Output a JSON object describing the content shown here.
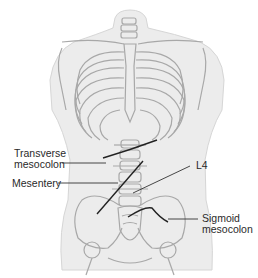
{
  "figure": {
    "colors": {
      "body": "#ececec",
      "bone": "#a8a8a8",
      "leader": "#333333",
      "vessel": "#222222"
    },
    "labels": {
      "transverse_mesocolon": "Transverse\nmesocolon",
      "transverse_line1": "Transverse",
      "transverse_line2": "mesocolon",
      "mesentery": "Mesentery",
      "l4": "L4",
      "sigmoid_line1": "Sigmoid",
      "sigmoid_line2": "mesocolon"
    }
  }
}
